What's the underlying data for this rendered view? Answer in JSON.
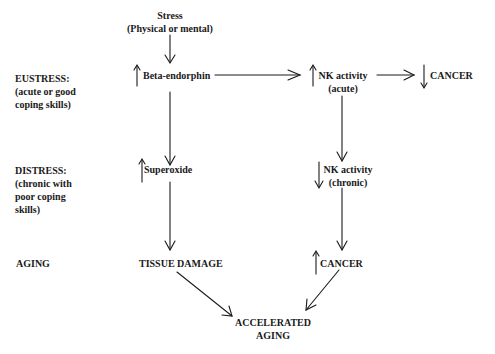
{
  "row_labels": {
    "eustress": [
      "EUSTRESS:",
      "(acute or good",
      "coping skills)"
    ],
    "distress": [
      "DISTRESS:",
      "(chronic with",
      "poor coping",
      "skills)"
    ],
    "aging": [
      "AGING"
    ]
  },
  "nodes": {
    "stress": [
      "Stress",
      "(Physical or mental)"
    ],
    "beta_endorphin": {
      "label": "Beta-endorphin",
      "direction": "up"
    },
    "nk_acute": {
      "lines": [
        "NK activity",
        "(acute)"
      ],
      "direction": "up"
    },
    "cancer_eustress": {
      "label": "CANCER",
      "direction": "down"
    },
    "superoxide": {
      "label": "Superoxide",
      "direction": "up"
    },
    "nk_chronic": {
      "lines": [
        "NK activity",
        "(chronic)"
      ],
      "direction": "down"
    },
    "tissue_damage": {
      "label": "TISSUE DAMAGE"
    },
    "cancer_aging": {
      "label": "CANCER",
      "direction": "up"
    },
    "accelerated_aging": [
      "ACCELERATED",
      "AGING"
    ]
  },
  "edges": [
    {
      "from": "stress",
      "to": "beta_endorphin"
    },
    {
      "from": "beta_endorphin",
      "to": "nk_acute"
    },
    {
      "from": "nk_acute",
      "to": "cancer_eustress"
    },
    {
      "from": "beta_endorphin",
      "to": "superoxide"
    },
    {
      "from": "nk_acute",
      "to": "nk_chronic"
    },
    {
      "from": "superoxide",
      "to": "tissue_damage"
    },
    {
      "from": "nk_chronic",
      "to": "cancer_aging"
    },
    {
      "from": "tissue_damage",
      "to": "accelerated_aging"
    },
    {
      "from": "cancer_aging",
      "to": "accelerated_aging"
    }
  ]
}
